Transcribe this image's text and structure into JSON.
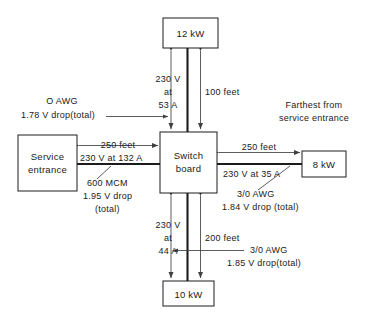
{
  "diagram": {
    "note": {
      "line1": "Farthest from",
      "line2": "service entrance"
    },
    "boxes": [
      {
        "name": "load-12kw",
        "label": "12 kW"
      },
      {
        "name": "service-entrance",
        "label_line1": "Service",
        "label_line2": "entrance"
      },
      {
        "name": "switchboard",
        "label_line1": "Switch",
        "label_line2": "board"
      },
      {
        "name": "load-8kw",
        "label": "8 kW"
      },
      {
        "name": "load-10kw",
        "label": "10 kW"
      }
    ],
    "branches": {
      "top": {
        "distance": "100 feet",
        "volt_line1": "230 V",
        "volt_line2": "at",
        "volt_line3": "53 A",
        "conductor": "O AWG",
        "vdrop": "1.78 V drop(total)"
      },
      "left": {
        "distance": "250 feet",
        "volt": "230 V at 132 A",
        "conductor": "600 MCM",
        "vdrop_line1": "1.95 V drop",
        "vdrop_line2": "(total)"
      },
      "right": {
        "distance": "250 feet",
        "volt": "230 V at 35 A",
        "conductor": "3/0 AWG",
        "vdrop": "1.84 V drop (total)"
      },
      "bottom": {
        "distance": "200 feet",
        "volt_line1": "230 V",
        "volt_line2": "at",
        "volt_line3": "44 A",
        "conductor": "3/0 AWG",
        "vdrop": "1.85 V drop(total)"
      }
    },
    "colors": {
      "ink": "#1c1c1c",
      "thin": "#404040",
      "paper": "#ffffff"
    }
  }
}
